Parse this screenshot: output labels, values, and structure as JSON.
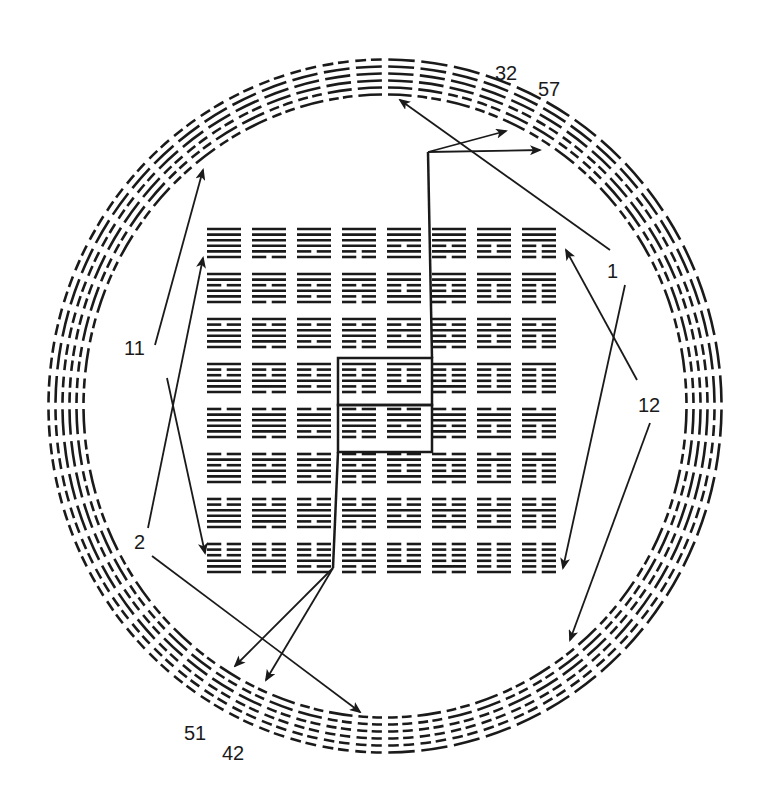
{
  "diagram": {
    "ink_color": "#1a1a1a",
    "background": "#ffffff",
    "ring": {
      "count": 64,
      "lines_per_hexagram": 6
    },
    "square": {
      "rows": 8,
      "cols": 8,
      "lines_per_hexagram": 6
    },
    "center_box": {
      "rows": [
        3,
        4
      ],
      "cols": [
        3,
        4
      ]
    },
    "labels": [
      {
        "id": "label-32",
        "text": "32"
      },
      {
        "id": "label-57",
        "text": "57"
      },
      {
        "id": "label-1",
        "text": "1"
      },
      {
        "id": "label-12",
        "text": "12"
      },
      {
        "id": "label-11",
        "text": "11"
      },
      {
        "id": "label-2",
        "text": "2"
      },
      {
        "id": "label-51",
        "text": "51"
      },
      {
        "id": "label-42",
        "text": "42"
      }
    ],
    "arrows": [
      {
        "from": "1",
        "to": "ring-top (hexagram 1)"
      },
      {
        "from": "1",
        "to": "ring-lower-right"
      },
      {
        "from": "12",
        "to": "square-top-right"
      },
      {
        "from": "12",
        "to": "ring-lower-right"
      },
      {
        "from": "11",
        "to": "ring-upper-left"
      },
      {
        "from": "11",
        "to": "square-bottom-left"
      },
      {
        "from": "2",
        "to": "square-top-left"
      },
      {
        "from": "2",
        "to": "ring-bottom (hexagram 2)"
      },
      {
        "from": "center-top",
        "to": "ring-32"
      },
      {
        "from": "center-top",
        "to": "ring-57"
      },
      {
        "from": "center-bottom",
        "to": "ring-51"
      },
      {
        "from": "center-bottom",
        "to": "ring-42"
      }
    ]
  }
}
